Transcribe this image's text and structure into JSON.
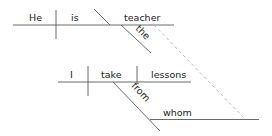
{
  "diagram": {
    "type": "sentence-diagram",
    "clause_main": {
      "subject": "He",
      "verb": "is",
      "complement": "teacher",
      "modifier": "the"
    },
    "clause_relative": {
      "subject": "I",
      "verb": "take",
      "object": "lessons",
      "preposition": "from",
      "prep_object": "whom"
    },
    "colors": {
      "text": "#222222",
      "line": "#5a5a5a",
      "dashed_link": "#b0b0b0",
      "background": "#ffffff"
    }
  }
}
